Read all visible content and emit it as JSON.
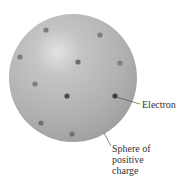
{
  "sphere": {
    "cx": 73,
    "cy": 78,
    "r": 64,
    "fill": "#b3b3b3",
    "highlight": "#e6e6e6",
    "edge": "#9c9c9c"
  },
  "electrons": [
    {
      "x": 46,
      "y": 30,
      "shade": "#7d7d7d"
    },
    {
      "x": 100,
      "y": 35,
      "shade": "#7d7d7d"
    },
    {
      "x": 20,
      "y": 57,
      "shade": "#7d7d7d"
    },
    {
      "x": 78,
      "y": 62,
      "shade": "#6e6e6e"
    },
    {
      "x": 120,
      "y": 63,
      "shade": "#7d7d7d"
    },
    {
      "x": 35,
      "y": 84,
      "shade": "#7d7d7d"
    },
    {
      "x": 67,
      "y": 96,
      "shade": "#4a4a4a"
    },
    {
      "x": 115,
      "y": 96,
      "shade": "#3f3f3f"
    },
    {
      "x": 41,
      "y": 123,
      "shade": "#707070"
    },
    {
      "x": 72,
      "y": 134,
      "shade": "#707070"
    }
  ],
  "labels": {
    "electron": "Electron",
    "sphere_line1": "Sphere of",
    "sphere_line2": "positive",
    "sphere_line3": "charge"
  }
}
